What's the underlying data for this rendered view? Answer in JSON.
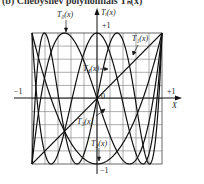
{
  "caption": "(b) Chebyshev polynomials Tₙ(x)",
  "chart_data": {
    "type": "line",
    "xlabel": "X",
    "ylabel": "Tᵢ(x)",
    "xlim": [
      -1,
      1
    ],
    "ylim": [
      -1,
      1
    ],
    "grid": true,
    "grid_divisions": 10,
    "tick_labels": {
      "x_left": "−1",
      "x_right": "+1",
      "y_top": "+1",
      "y_bottom": "−1",
      "origin": "0"
    },
    "series": [
      {
        "name": "T₁(x)",
        "order": 1,
        "formula": "x"
      },
      {
        "name": "T₂(x)",
        "order": 2,
        "formula": "2x^2-1"
      },
      {
        "name": "T₃(x)",
        "order": 3,
        "formula": "4x^3-3x"
      },
      {
        "name": "T₄(x)",
        "order": 4,
        "formula": "8x^4-8x^2+1"
      },
      {
        "name": "T₀(x)",
        "order": 5,
        "formula": "16x^5-20x^3+5x"
      }
    ],
    "annotations": [
      {
        "text": "T₀(x)",
        "position": "top-left, arrow pointing down to curve"
      },
      {
        "text": "Tᵢ(x)",
        "position": "y-axis top"
      },
      {
        "text": "T₁(x)",
        "position": "upper right, on diagonal"
      },
      {
        "text": "T₄(x)",
        "position": "center upper"
      },
      {
        "text": "T₃(x)",
        "position": "center lower"
      },
      {
        "text": "T₂(x)",
        "position": "bottom center"
      }
    ]
  },
  "labels": {
    "t0": "T₀(x)",
    "ti": "Tᵢ(x)",
    "t1": "T₁(x)",
    "t4": "T₄(x)",
    "t3": "T₃(x)",
    "t2": "T₂(x)",
    "x_axis": "X",
    "plus1_y": "+1",
    "minus1_y": "−1",
    "plus1_x": "+1",
    "minus1_x": "−1",
    "origin": "0"
  }
}
